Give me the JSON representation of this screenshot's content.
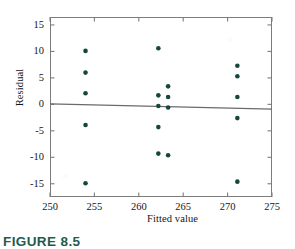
{
  "figure": {
    "caption": "FIGURE 8.5",
    "caption_color": "#1d5c4d"
  },
  "chart_data": {
    "type": "scatter",
    "title": "",
    "xlabel": "Fitted value",
    "ylabel": "Residual",
    "xlim": [
      250,
      275
    ],
    "ylim": [
      -17.5,
      16.5
    ],
    "xticks": [
      250,
      255,
      260,
      265,
      270,
      275
    ],
    "yticks": [
      -15,
      -10,
      -5,
      0,
      5,
      10,
      15
    ],
    "xtick_labels": [
      "250",
      "255",
      "260",
      "265",
      "270",
      "275"
    ],
    "ytick_labels": [
      "15",
      "10",
      "5",
      "0",
      "-5",
      "-10",
      "-15"
    ],
    "grid": false,
    "legend": null,
    "marker_color": "#17473c",
    "marker_size": 4.6,
    "axis_color": "#7c7c7c",
    "reference_line": {
      "name": "zero-residual-line",
      "color": "#6b6b6b",
      "x_start": 250.0,
      "y_start": 0.1,
      "x_end": 275.0,
      "y_end": -0.9
    },
    "points": [
      {
        "x": 254.0,
        "y": 10.1
      },
      {
        "x": 254.0,
        "y": 6.0
      },
      {
        "x": 254.0,
        "y": 2.1
      },
      {
        "x": 254.0,
        "y": -3.9
      },
      {
        "x": 254.0,
        "y": -14.9
      },
      {
        "x": 262.2,
        "y": 10.6
      },
      {
        "x": 262.2,
        "y": 1.7
      },
      {
        "x": 262.2,
        "y": -0.3
      },
      {
        "x": 262.2,
        "y": -4.3
      },
      {
        "x": 262.2,
        "y": -9.3
      },
      {
        "x": 263.3,
        "y": 3.4
      },
      {
        "x": 263.3,
        "y": 1.4
      },
      {
        "x": 263.3,
        "y": -0.6
      },
      {
        "x": 263.3,
        "y": -9.6
      },
      {
        "x": 271.1,
        "y": 7.3
      },
      {
        "x": 271.1,
        "y": 5.3
      },
      {
        "x": 271.1,
        "y": 1.4
      },
      {
        "x": 271.1,
        "y": -2.6
      },
      {
        "x": 271.1,
        "y": -14.6
      }
    ]
  }
}
